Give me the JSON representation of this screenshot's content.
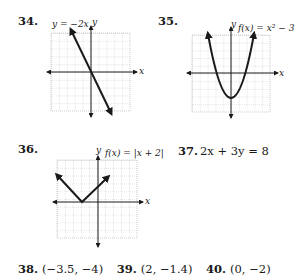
{
  "problems": [
    {
      "number": "34.",
      "equation_label": "y = −2x",
      "axis_x": "x",
      "axis_y": "y",
      "graph": {
        "type": "line",
        "function": "y = -2x",
        "slope": -2,
        "intercept": 0,
        "grid_range": [
          -5,
          5
        ]
      }
    },
    {
      "number": "35.",
      "equation_label": "f(x) = x² − 3",
      "axis_x": "x",
      "axis_y": "y",
      "graph": {
        "type": "parabola",
        "function": "f(x) = x^2 - 3",
        "vertex": [
          0,
          -3
        ],
        "grid_range": [
          -5,
          5
        ]
      }
    },
    {
      "number": "36.",
      "equation_label": "f(x) = |x + 2|",
      "axis_x": "x",
      "axis_y": "y",
      "graph": {
        "type": "absolute-value",
        "function": "f(x) = |x + 2|",
        "vertex": [
          -2,
          0
        ],
        "grid_range": [
          -5,
          5
        ]
      }
    },
    {
      "number": "37.",
      "equation": "2x + 3y = 8"
    }
  ],
  "bottom_row": [
    {
      "number": "38.",
      "answer": "(−3.5, −4)"
    },
    {
      "number": "39.",
      "answer": "(2, −1.4)"
    },
    {
      "number": "40.",
      "answer": "(0, −2)"
    }
  ]
}
